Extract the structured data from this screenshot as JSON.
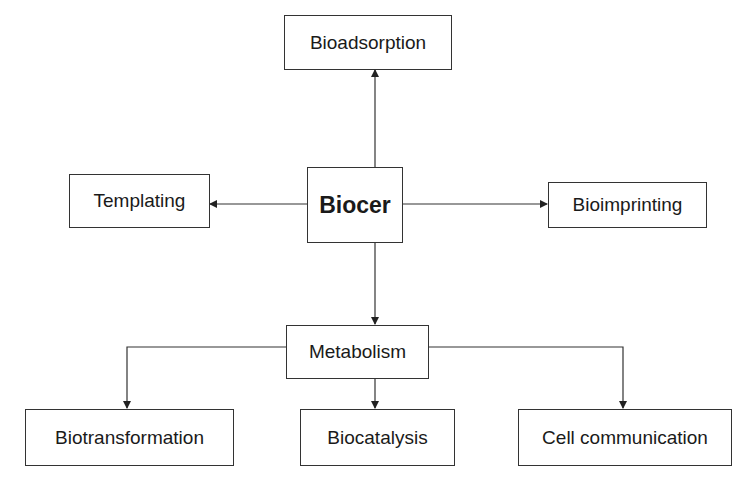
{
  "diagram": {
    "center": {
      "label": "Biocer"
    },
    "top": {
      "label": "Bioadsorption"
    },
    "left": {
      "label": "Templating"
    },
    "right": {
      "label": "Bioimprinting"
    },
    "middle": {
      "label": "Metabolism"
    },
    "children": [
      {
        "label": "Biotransformation"
      },
      {
        "label": "Biocatalysis"
      },
      {
        "label": "Cell communication"
      }
    ],
    "edges": [
      [
        "Biocer",
        "Bioadsorption"
      ],
      [
        "Biocer",
        "Templating"
      ],
      [
        "Biocer",
        "Bioimprinting"
      ],
      [
        "Biocer",
        "Metabolism"
      ],
      [
        "Metabolism",
        "Biotransformation"
      ],
      [
        "Metabolism",
        "Biocatalysis"
      ],
      [
        "Metabolism",
        "Cell communication"
      ]
    ]
  }
}
